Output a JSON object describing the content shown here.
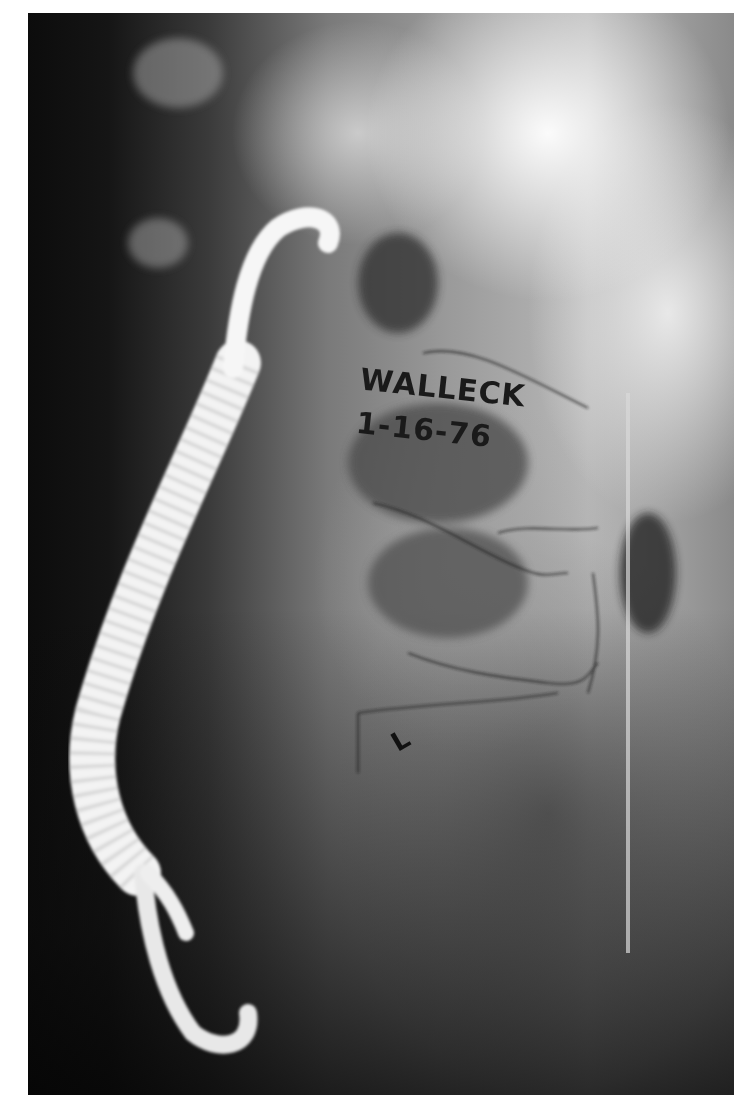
{
  "image": {
    "subject": "x-ray",
    "annotations": {
      "name": "WALLECK",
      "date": "1-16-76",
      "lower_mark": "L"
    },
    "colors": {
      "background": "#ffffff",
      "film_dark": "#0c0c0c",
      "device": "#f4f4f4",
      "ink": "#1a1a1a"
    }
  }
}
